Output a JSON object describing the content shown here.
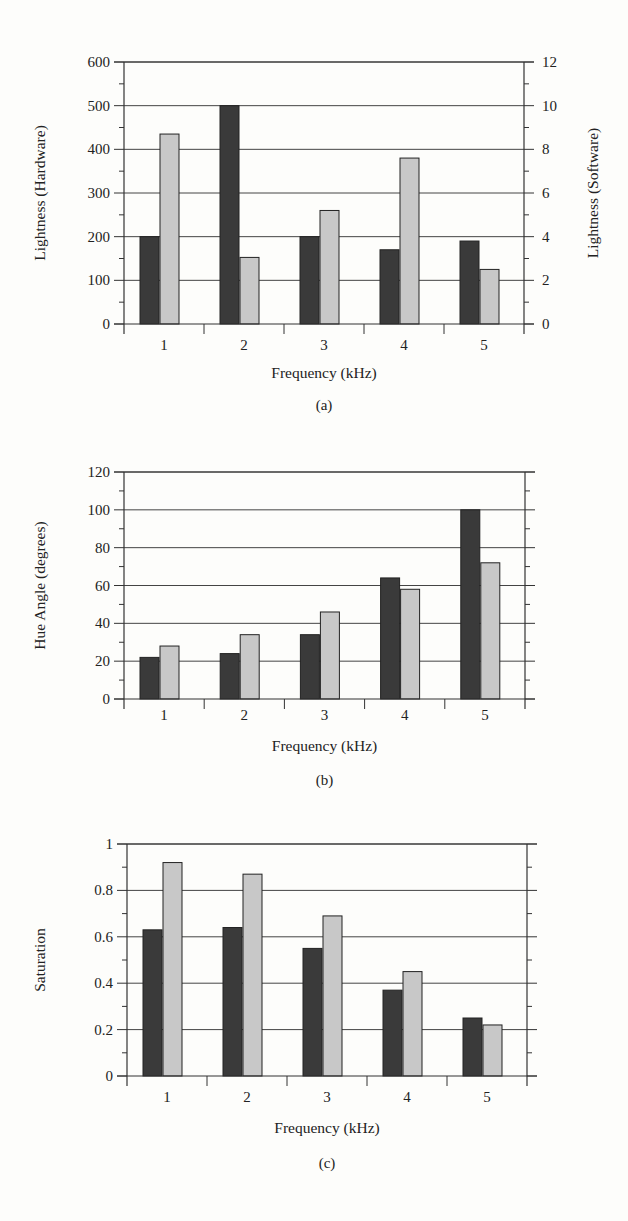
{
  "chart_data": [
    {
      "id": "a",
      "type": "bar",
      "caption": "(a)",
      "xlabel": "Frequency (kHz)",
      "ylabel": "Lightness (Hardware)",
      "ylabel_right": "Lightness (Software)",
      "categories": [
        "1",
        "2",
        "3",
        "4",
        "5"
      ],
      "ylim": [
        0,
        600
      ],
      "yticks": [
        0,
        100,
        200,
        300,
        400,
        500,
        600
      ],
      "ylim_right": [
        0,
        12
      ],
      "yticks_right": [
        0,
        2,
        4,
        6,
        8,
        10,
        12
      ],
      "grid": true,
      "series": [
        {
          "name": "Hardware",
          "axis": "left",
          "color": "#3a3a3a",
          "values": [
            200,
            500,
            200,
            170,
            190
          ]
        },
        {
          "name": "Software",
          "axis": "right",
          "color": "#c8c8c8",
          "values": [
            8.7,
            3.05,
            5.2,
            7.6,
            2.5
          ]
        }
      ]
    },
    {
      "id": "b",
      "type": "bar",
      "caption": "(b)",
      "xlabel": "Frequency (kHz)",
      "ylabel": "Hue Angle (degrees)",
      "categories": [
        "1",
        "2",
        "3",
        "4",
        "5"
      ],
      "ylim": [
        0,
        120
      ],
      "yticks": [
        0,
        20,
        40,
        60,
        80,
        100,
        120
      ],
      "grid": true,
      "series": [
        {
          "name": "Hardware",
          "color": "#3a3a3a",
          "values": [
            22,
            24,
            34,
            64,
            100
          ]
        },
        {
          "name": "Software",
          "color": "#c8c8c8",
          "values": [
            28,
            34,
            46,
            58,
            72
          ]
        }
      ]
    },
    {
      "id": "c",
      "type": "bar",
      "caption": "(c)",
      "xlabel": "Frequency (kHz)",
      "ylabel": "Saturation",
      "categories": [
        "1",
        "2",
        "3",
        "4",
        "5"
      ],
      "ylim": [
        0,
        1
      ],
      "yticks": [
        0,
        0.2,
        0.4,
        0.6,
        0.8,
        1
      ],
      "ytick_labels": [
        "0",
        "0.2",
        "0.4",
        "0.6",
        "0.8",
        "1"
      ],
      "grid": true,
      "series": [
        {
          "name": "Hardware",
          "color": "#3a3a3a",
          "values": [
            0.63,
            0.64,
            0.55,
            0.37,
            0.25
          ]
        },
        {
          "name": "Software",
          "color": "#c8c8c8",
          "values": [
            0.92,
            0.87,
            0.69,
            0.45,
            0.22
          ]
        }
      ]
    }
  ]
}
